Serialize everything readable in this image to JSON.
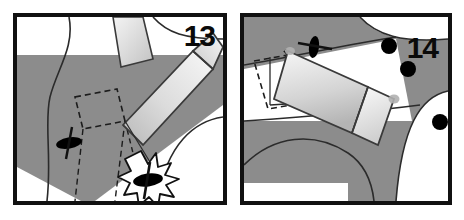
{
  "figure": {
    "kind": "two-panel vehicle swept-path diagram",
    "background_color": "#ffffff",
    "frame_color": "#111111"
  },
  "panels": [
    {
      "id": "panel-13",
      "number": "13",
      "number_color": "#0a0a0a",
      "shading_color": "#8c8c8c",
      "road_line_color": "#2b2b2b",
      "vehicle": {
        "body_fill_light": "#f2f2f2",
        "body_fill_dark": "#b8b8b8",
        "outline_color": "#3a3a3a",
        "orientation": "diagonal, nose down-left",
        "ghost_outline_style": "dashed"
      },
      "markers": [
        {
          "name": "post-marker",
          "symbol": "oval-with-cross",
          "color": "#000000",
          "x": 58,
          "y": 135
        },
        {
          "name": "struck-post-marker",
          "symbol": "oval-with-cross",
          "color": "#000000",
          "x": 131,
          "y": 170
        }
      ],
      "impact": {
        "name": "collision-starburst",
        "visible": "true",
        "fill": "#ffffff",
        "stroke": "#111111",
        "x": 131,
        "y": 170
      }
    },
    {
      "id": "panel-14",
      "number": "14",
      "number_color": "#0a0a0a",
      "shading_color": "#8c8c8c",
      "road_line_color": "#2b2b2b",
      "vehicle": {
        "body_fill_light": "#f6f6f6",
        "body_fill_dark": "#b4b4b4",
        "outline_color": "#3a3a3a",
        "orientation": "diagonal, nose down-right",
        "ghost_outline_style": "dashed"
      },
      "markers": [
        {
          "name": "post-marker",
          "symbol": "oval-with-cross",
          "color": "#000000",
          "x": 310,
          "y": 42
        }
      ],
      "bollards": [
        {
          "name": "bollard-dot",
          "color": "#000000",
          "x": 385,
          "y": 42,
          "r": 7
        },
        {
          "name": "bollard-dot",
          "color": "#000000",
          "x": 404,
          "y": 65,
          "r": 7
        },
        {
          "name": "bollard-dot",
          "color": "#000000",
          "x": 438,
          "y": 118,
          "r": 7
        }
      ],
      "impact": {
        "name": "collision-starburst",
        "visible": "false"
      }
    }
  ]
}
